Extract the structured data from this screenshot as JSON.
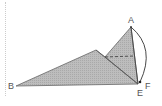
{
  "diagram": {
    "type": "geometry-figure",
    "points": {
      "A": {
        "label": "A",
        "x": 131,
        "y": 27
      },
      "B": {
        "label": "B",
        "x": 16,
        "y": 86
      },
      "E": {
        "label": "E",
        "x": 138,
        "y": 84
      },
      "F": {
        "label": "F",
        "x": 140,
        "y": 82
      },
      "P": {
        "label": "",
        "x": 96,
        "y": 50
      },
      "Q": {
        "label": "",
        "x": 105,
        "y": 57
      },
      "D": {
        "label": "",
        "x": 134,
        "y": 56
      }
    },
    "labels": {
      "A": "A",
      "B": "B",
      "E": "E",
      "F": "F"
    },
    "colors": {
      "fill": "#b5b5b5",
      "stroke": "#555555",
      "arc": "#333333",
      "dashed": "#444444"
    }
  }
}
